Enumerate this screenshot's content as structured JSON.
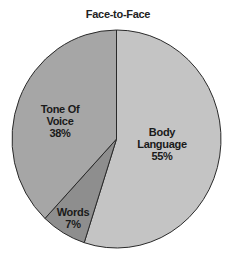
{
  "chart_data": {
    "type": "pie",
    "title": "Face-to-Face",
    "categories": [
      "Body Language",
      "Words",
      "Tone Of Voice"
    ],
    "values": [
      55,
      7,
      38
    ],
    "unit": "%",
    "colors": [
      "#c4c4c4",
      "#8e8e8e",
      "#a6a6a6"
    ],
    "start_angle_deg": 0,
    "direction": "clockwise",
    "legend": "none",
    "slice_labels": [
      {
        "lines": [
          "Body",
          "Language"
        ],
        "value": "55%"
      },
      {
        "lines": [
          "Words"
        ],
        "value": "7%"
      },
      {
        "lines": [
          "Tone Of",
          "Voice"
        ],
        "value": "38%"
      }
    ]
  }
}
